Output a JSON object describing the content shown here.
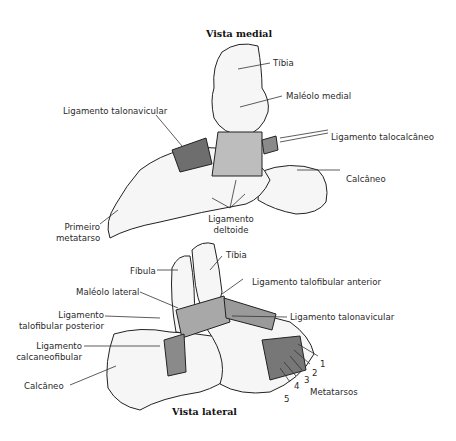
{
  "medial_view": {
    "title": "Vista medial",
    "labels": {
      "tibia": "Tíbia",
      "medial_malleolus": "Maléolo medial",
      "talonavicular_ligament": "Ligamento talonavicular",
      "talocalcaneal_ligament": "Ligamento talocalcâneo",
      "calcaneus": "Calcâneo",
      "first_metatarsal_line1": "Primeiro",
      "first_metatarsal_line2": "metatarso",
      "deltoid_ligament_line1": "Ligamento",
      "deltoid_ligament_line2": "deltoide"
    }
  },
  "lateral_view": {
    "title": "Vista lateral",
    "labels": {
      "tibia": "Tíbia",
      "fibula": "Fíbula",
      "lateral_malleolus": "Maléolo lateral",
      "anterior_talofibular_ligament": "Ligamento talofibular anterior",
      "posterior_talofibular_ligament_line1": "Ligamento",
      "posterior_talofibular_ligament_line2": "talofibular posterior",
      "talonavicular_ligament": "Ligamento talonavicular",
      "calcaneofibular_ligament_line1": "Ligamento",
      "calcaneofibular_ligament_line2": "calcaneofibular",
      "calcaneus": "Calcâneo",
      "metatarsals": "Metatarsos",
      "metatarsal_numbers": [
        "1",
        "2",
        "3",
        "4",
        "5"
      ]
    }
  }
}
